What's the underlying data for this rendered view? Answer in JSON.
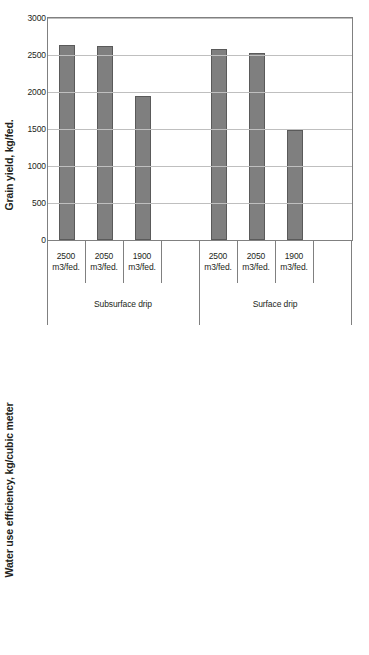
{
  "figure": {
    "background": "#ffffff",
    "bar_color": "#7f7f7f",
    "bar_edge_color": "#5a5a5a",
    "grid_color": "#bfbfbf",
    "axis_color": "#808080"
  },
  "chart_data": [
    {
      "type": "bar",
      "title": "",
      "xlabel": "",
      "ylabel": "Grain yield, kg/fed.",
      "ylim": [
        0,
        3000
      ],
      "yticks": [
        "0",
        "500",
        "1000",
        "1500",
        "2000",
        "2500",
        "3000"
      ],
      "ytick_values": [
        0,
        500,
        1000,
        1500,
        2000,
        2500,
        3000
      ],
      "grid": true,
      "legend": "none",
      "groups": [
        {
          "name": "Subsurface drip",
          "categories": [
            "2500 m3/fed.",
            "2050 m3/fed.",
            "1900 m3/fed."
          ],
          "values": [
            2635,
            2625,
            1945
          ]
        },
        {
          "name": "Surface drip",
          "categories": [
            "2500 m3/fed.",
            "2050 m3/fed.",
            "1900 m3/fed."
          ],
          "values": [
            2580,
            2525,
            1480
          ]
        }
      ]
    },
    {
      "type": "bar",
      "title": "",
      "xlabel": "",
      "ylabel": "Water use efficiency, kg/cubic meter",
      "ylim": [
        0,
        1.4
      ],
      "yticks": [
        "0",
        "0.2",
        "0.4",
        "0.6",
        "0.8",
        "1",
        "1.2",
        "1.4"
      ],
      "ytick_values": [
        0,
        0.2,
        0.4,
        0.6,
        0.8,
        1.0,
        1.2,
        1.4
      ],
      "grid": true,
      "legend": "none",
      "groups": [
        {
          "name": "Subsurface drip",
          "categories": [
            "2500 m3/fed.",
            "2050 m3/fed.",
            "1900 m3/fed."
          ],
          "values": [
            1.06,
            1.28,
            1.03
          ]
        },
        {
          "name": "Surface drip",
          "categories": [
            "2500 m3/fed.",
            "2050 m3/fed.",
            "1900 m3/fed."
          ],
          "values": [
            1.04,
            1.23,
            0.78
          ]
        }
      ]
    }
  ],
  "category_labels": {
    "line1": [
      "2500",
      "2050",
      "1900"
    ],
    "line2": "m3/fed."
  },
  "group_labels": [
    "Subsurface drip",
    "Surface drip"
  ]
}
